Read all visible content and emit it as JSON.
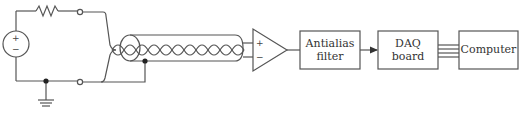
{
  "diagram": {
    "type": "signal-acquisition-block-diagram",
    "source": {
      "plus_sign": "+",
      "minus_sign": "−"
    },
    "amplifier": {
      "plus_input": "+",
      "minus_input": "−"
    },
    "blocks": [
      {
        "id": "antialias",
        "line1": "Antialias",
        "line2": "filter"
      },
      {
        "id": "daq",
        "line1": "DAQ",
        "line2": "board"
      },
      {
        "id": "computer",
        "line1": "Computer"
      }
    ],
    "colors": {
      "stroke": "#555555",
      "background": "#ffffff",
      "text": "#333333"
    },
    "components": [
      "voltage-source",
      "resistor",
      "terminals",
      "ground",
      "shielded-twisted-pair-cable",
      "differential-amplifier",
      "antialias-filter",
      "daq-board",
      "computer"
    ]
  }
}
